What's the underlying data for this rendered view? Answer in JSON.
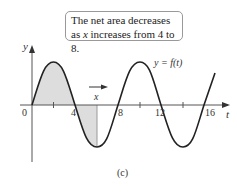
{
  "callout": {
    "line1": "The net area decreases",
    "line2_pre": "as ",
    "line2_var": "x",
    "line2_post": " increases from 4 to 8."
  },
  "axes": {
    "y_label": "y",
    "t_label": "t",
    "x_marker_label": "x",
    "tick_labels": [
      "0",
      "4",
      "8",
      "12",
      "16"
    ]
  },
  "curve_label": "y = f(t)",
  "caption": "(c)",
  "colors": {
    "curve": "#222222",
    "shade": "#dddddd",
    "axis": "#555555"
  }
}
